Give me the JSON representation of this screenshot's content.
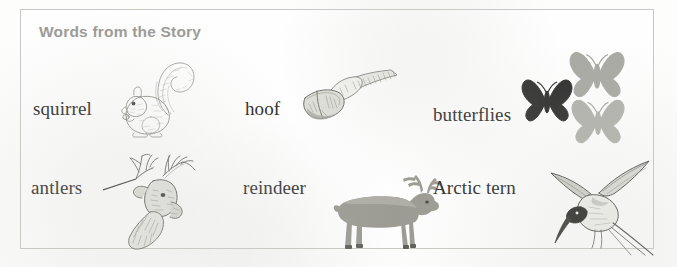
{
  "panel": {
    "title": "Words from the Story",
    "border_color": "#c9c9c4",
    "title_color": "#9a9a97",
    "background_color": "#fdfdfc"
  },
  "entries": [
    {
      "word": "squirrel",
      "icon": "squirrel-illustration",
      "art_style": "pencil-sketch",
      "art_color": "#8d8d88",
      "row": 1,
      "column": 1
    },
    {
      "word": "hoof",
      "icon": "hoof-illustration",
      "art_style": "pencil-sketch",
      "art_color": "#7d7d78",
      "row": 1,
      "column": 2
    },
    {
      "word": "butterflies",
      "icon": "butterflies-illustration",
      "art_style": "silhouette",
      "art_color": "#2e2e2e",
      "art_color_secondary": "#a9a9a4",
      "row": 1,
      "column": 3
    },
    {
      "word": "antlers",
      "icon": "antlers-illustration",
      "art_style": "pencil-sketch-with-leader-line",
      "art_color": "#6f6f6a",
      "row": 2,
      "column": 1
    },
    {
      "word": "reindeer",
      "icon": "reindeer-illustration",
      "art_style": "flat-silhouette",
      "art_color": "#9b9b93",
      "row": 2,
      "column": 2
    },
    {
      "word": "Arctic tern",
      "icon": "arctic-tern-illustration",
      "art_style": "pencil-sketch",
      "art_color": "#55554f",
      "row": 2,
      "column": 3
    }
  ]
}
